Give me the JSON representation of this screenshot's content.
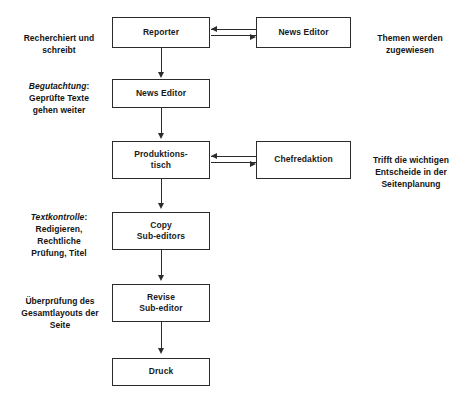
{
  "diagram": {
    "type": "flowchart",
    "language": "de",
    "colors": {
      "stroke": "#2b2b2b",
      "text": "#1a1a1a",
      "background": "#ffffff"
    },
    "nodes": [
      {
        "id": "reporter",
        "label": "Reporter"
      },
      {
        "id": "news-editor-1",
        "label": "News Editor"
      },
      {
        "id": "news-editor-2",
        "label": "News Editor"
      },
      {
        "id": "produktionstisch",
        "label": "Produktions-\ntisch"
      },
      {
        "id": "chefredaktion",
        "label": "Chefredaktion"
      },
      {
        "id": "copy-subeditors",
        "label": "Copy\nSub-editors"
      },
      {
        "id": "revise-subeditor",
        "label": "Revise\nSub-editor"
      },
      {
        "id": "druck",
        "label": "Druck"
      }
    ],
    "annotations_left": [
      {
        "id": "recherchiert",
        "emphasis": "",
        "text": "Recherchiert und\nschreibt"
      },
      {
        "id": "begutachtung",
        "emphasis": "Begutachtung",
        "text": ":\nGeprüfte Texte\ngehen weiter"
      },
      {
        "id": "textkontrolle",
        "emphasis": "Textkontrolle",
        "text": ":\nRedigieren,\nRechtliche\nPrüfung, Titel"
      },
      {
        "id": "ueberpruefung",
        "emphasis": "",
        "text": "Überprüfung des\nGesamtlayouts der\nSeite"
      }
    ],
    "annotations_right": [
      {
        "id": "themen",
        "text": "Themen werden\nzugewiesen"
      },
      {
        "id": "entscheide",
        "text": "Trifft die wichtigen\nEntscheide in der\nSeitenplanung"
      }
    ],
    "edges": [
      {
        "from": "reporter",
        "to": "news-editor-1",
        "direction": "bidirectional",
        "style": "double-rule"
      },
      {
        "from": "reporter",
        "to": "news-editor-2",
        "direction": "down",
        "style": "single"
      },
      {
        "from": "news-editor-2",
        "to": "produktionstisch",
        "direction": "down",
        "style": "single"
      },
      {
        "from": "produktionstisch",
        "to": "chefredaktion",
        "direction": "bidirectional",
        "style": "double-rule"
      },
      {
        "from": "produktionstisch",
        "to": "copy-subeditors",
        "direction": "down",
        "style": "single"
      },
      {
        "from": "copy-subeditors",
        "to": "revise-subeditor",
        "direction": "down",
        "style": "single"
      },
      {
        "from": "revise-subeditor",
        "to": "druck",
        "direction": "down",
        "style": "single"
      }
    ]
  }
}
